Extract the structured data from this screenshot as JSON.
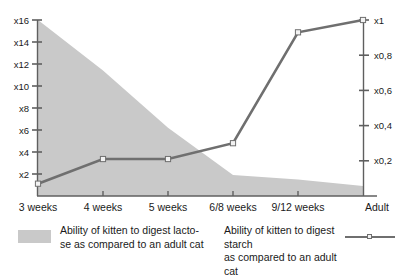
{
  "chart_data": {
    "type": "area",
    "title": "",
    "xlabel": "",
    "ylabel": "",
    "categories": [
      "3 weeks",
      "4 weeks",
      "5 weeks",
      "6/8 weeks",
      "9/12 weeks",
      "Adult"
    ],
    "grid": false,
    "legend_position": "bottom",
    "axes": {
      "left": {
        "ticks": [
          "x2",
          "x4",
          "x6",
          "x8",
          "x10",
          "x12",
          "x14",
          "x16"
        ],
        "values": [
          2,
          4,
          6,
          8,
          10,
          12,
          14,
          16
        ],
        "ylim": [
          0,
          16
        ]
      },
      "right": {
        "ticks": [
          "x0,2",
          "x0,4",
          "x0,6",
          "x0,8",
          "x1"
        ],
        "values": [
          0.2,
          0.4,
          0.6,
          0.8,
          1.0
        ],
        "ylim": [
          0,
          1.0
        ]
      }
    },
    "series": [
      {
        "name": "Ability of kitten to digest lactose as compared to an adult cat",
        "render": "area",
        "axis": "left",
        "color": "#c9c9c9",
        "values": [
          16.0,
          11.4,
          6.2,
          1.9,
          1.5,
          0.9
        ]
      },
      {
        "name": "Ability of kitten to digest starch as compared to an adult cat",
        "render": "line",
        "axis": "right",
        "color": "#6f6f6f",
        "marker_color": "#f2f2f2",
        "values": [
          0.07,
          0.21,
          0.21,
          0.3,
          0.93,
          1.0
        ]
      }
    ]
  },
  "legend": {
    "area_label": "Ability of kitten to digest lacto-se as compared to an adult cat",
    "area_label_line1": "Ability of kitten to digest lacto-",
    "area_label_line2": "se as compared to an adult cat",
    "line_label_line1": "Ability of kitten to digest starch",
    "line_label_line2": "as compared to an adult cat",
    "area_color": "#c9c9c9",
    "line_color": "#6f6f6f"
  }
}
